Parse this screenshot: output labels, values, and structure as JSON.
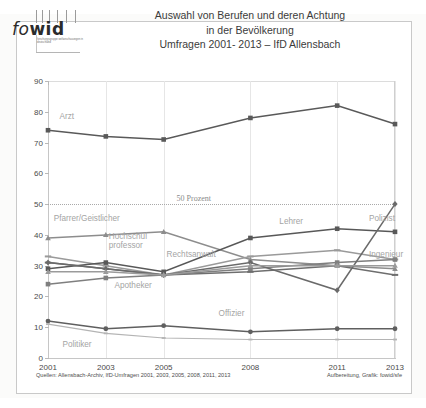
{
  "logo": {
    "word_a": "fo",
    "word_b": "w",
    "word_c": "id",
    "subtitle": "forschungsgruppe weltanschauungen in deutschland"
  },
  "title": {
    "line1": "Auswahl von Berufen und deren Achtung",
    "line2": "in der Bevölkerung",
    "line3": "Umfragen 2001- 2013 – IfD Allensbach"
  },
  "footer": {
    "sources": "Quellen: Allensbach-Archiv, IfD-Umfragen 2001, 2003, 2005, 2008, 2011, 2013",
    "credit": "Aufbereitung, Grafik: fowid/sfe"
  },
  "annotations": {
    "fifty_percent": "50 Prozent"
  },
  "colors": {
    "arzt": "#595959",
    "pfarrer": "#8d8d8d",
    "hochschulprofessor": "#9a9a9a",
    "rechtsanwalt": "#6e6e6e",
    "apotheker": "#7f7f7f",
    "lehrer": "#585858",
    "polizist": "#6a6a6a",
    "ingenieur": "#9b9b9b",
    "offizier": "#5f5f5f",
    "politiker": "#b4b4b4",
    "frame": "#c9c9c9",
    "grid": "#e6e6e6"
  },
  "chart_data": {
    "type": "line",
    "xlabel": "",
    "ylabel": "",
    "categories": [
      "2001",
      "2003",
      "2005",
      "2008",
      "2011",
      "2013"
    ],
    "ylim": [
      0,
      90
    ],
    "yticks": [
      0,
      10,
      20,
      30,
      40,
      50,
      60,
      70,
      80,
      90
    ],
    "grid": true,
    "legend": "inline-labels",
    "reference_line": {
      "value": 50,
      "label": "50 Prozent",
      "style": "dotted"
    },
    "series": [
      {
        "name": "Arzt",
        "values": [
          74,
          72,
          71,
          78,
          82,
          76
        ]
      },
      {
        "name": "Pfarrer/Geistlicher",
        "values": [
          39,
          40,
          41,
          32,
          30,
          29
        ]
      },
      {
        "name": "Hochschulprofessor",
        "values": [
          33,
          30,
          27,
          33,
          35,
          32
        ]
      },
      {
        "name": "Rechtsanwalt",
        "values": [
          31,
          29,
          27,
          28,
          30,
          27
        ]
      },
      {
        "name": "Apotheker",
        "values": [
          24,
          26,
          27,
          29,
          31,
          32
        ]
      },
      {
        "name": "Lehrer",
        "values": [
          29,
          31,
          28,
          39,
          42,
          41
        ]
      },
      {
        "name": "Polizist",
        "values": [
          31,
          29,
          27,
          31,
          22,
          50
        ]
      },
      {
        "name": "Ingenieur",
        "values": [
          28,
          28,
          27,
          30,
          30,
          30
        ]
      },
      {
        "name": "Offizier",
        "values": [
          12,
          9.5,
          10.5,
          8.5,
          9.5,
          9.5
        ]
      },
      {
        "name": "Politiker",
        "values": [
          11,
          8,
          6.5,
          6,
          6,
          6
        ]
      }
    ],
    "series_labels": [
      {
        "name": "Arzt",
        "text": "Arzt",
        "x": 2001.4,
        "y": 78
      },
      {
        "name": "Pfarrer/Geistlicher",
        "text": "Pfarrer/Geistlicher",
        "x": 2001.2,
        "y": 45
      },
      {
        "name": "Hochschulprofessor",
        "text": "Hochschul\nprofessor",
        "x": 2003.1,
        "y": 39
      },
      {
        "name": "Rechtsanwalt",
        "text": "Rechtsanwalt",
        "x": 2005.1,
        "y": 33
      },
      {
        "name": "Apotheker",
        "text": "Apotheker",
        "x": 2003.3,
        "y": 23
      },
      {
        "name": "Lehrer",
        "text": "Lehrer",
        "x": 2009.0,
        "y": 44
      },
      {
        "name": "Polizist",
        "text": "Polizist",
        "x": 2012.1,
        "y": 45
      },
      {
        "name": "Ingenieur",
        "text": "Ingenieur",
        "x": 2012.1,
        "y": 33
      },
      {
        "name": "Offizier",
        "text": "Offizier",
        "x": 2006.9,
        "y": 14
      },
      {
        "name": "Politiker",
        "text": "Politiker",
        "x": 2001.5,
        "y": 4
      }
    ]
  }
}
